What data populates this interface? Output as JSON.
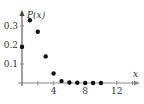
{
  "chart_data": {
    "type": "scatter",
    "title": "",
    "xlabel": "x",
    "ylabel": "P(x)",
    "x": [
      0,
      1,
      2,
      3,
      4,
      5,
      6,
      7,
      8,
      9,
      10
    ],
    "values": [
      0.19,
      0.33,
      0.27,
      0.14,
      0.05,
      0.01,
      0.003,
      0.001,
      0.0,
      0.0,
      0.0
    ],
    "xticks": [
      4,
      8,
      12
    ],
    "yticks": [
      0.1,
      0.2,
      0.3
    ],
    "xlim": [
      0,
      14
    ],
    "ylim": [
      0,
      0.37
    ],
    "grid": false,
    "legend": null
  },
  "labels": {
    "y_axis": "P(x)",
    "x_axis": "x",
    "xtick_labels": [
      "4",
      "8",
      "12"
    ],
    "ytick_labels": [
      "0.1",
      "0.2",
      "0.3"
    ]
  },
  "colors": {
    "axis": "#8a8a8a",
    "point": "#111111",
    "text": "#333333"
  }
}
